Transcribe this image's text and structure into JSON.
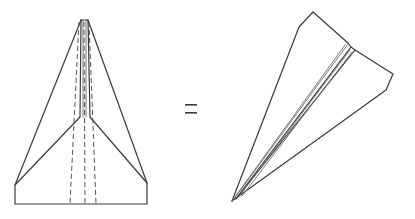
{
  "diagram": {
    "title": "Paper airplane: top view equals folded perspective view",
    "left_figure": {
      "label": "Paper airplane top view (unfolded wings, dashed fold lines)",
      "apex": [
        84,
        20
      ],
      "bottom_left": [
        15,
        204
      ],
      "bottom_right": [
        147,
        204
      ],
      "side_top_left": [
        15,
        185
      ],
      "side_top_right": [
        147,
        183
      ],
      "inner_fold_junction_y": 117,
      "dashed_lines_x": [
        70,
        85,
        96
      ]
    },
    "operator": {
      "symbol": "=",
      "position": [
        191,
        109
      ]
    },
    "right_figure": {
      "label": "Folded paper airplane in perspective",
      "nose": [
        232,
        201
      ],
      "tail_peak": [
        313,
        12
      ],
      "left_shoulder": [
        301,
        26
      ],
      "fold_corner": [
        348,
        44
      ],
      "wing_tip": [
        393,
        74
      ]
    },
    "colors": {
      "background": "#ffffff",
      "line": "#3a3a3a"
    }
  }
}
